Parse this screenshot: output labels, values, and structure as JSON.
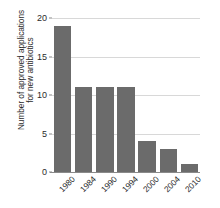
{
  "chart_data": {
    "type": "bar",
    "title": "",
    "subtitle": "",
    "xlabel": "",
    "ylabel": "Number of approved applications for new antibiotics",
    "ylabel_lines": [
      "Number of approved applications",
      "for new antibiotics"
    ],
    "categories": [
      "1980",
      "1984",
      "1990",
      "1994",
      "2000",
      "2004",
      "2010"
    ],
    "values": [
      19,
      11,
      11,
      11,
      4,
      3,
      1
    ],
    "ylim": [
      0,
      20
    ],
    "yticks": [
      0,
      5,
      10,
      15,
      20
    ],
    "ytick_labels": [
      "0",
      "5",
      "10",
      "15",
      "20"
    ],
    "xtick_rotation": -45,
    "grid": "horizontal",
    "legend": "none",
    "series": [
      {
        "name": "Approved applications for new antibiotics",
        "values": [
          19,
          11,
          11,
          11,
          4,
          3,
          1
        ]
      }
    ],
    "annotations": []
  },
  "style": {
    "bar_color": "#6b6b6b",
    "gridline_color": "#d8d8d8",
    "axis_color": "#8a8a8a",
    "text_color": "#2b2b2b",
    "background": "#ffffff"
  }
}
